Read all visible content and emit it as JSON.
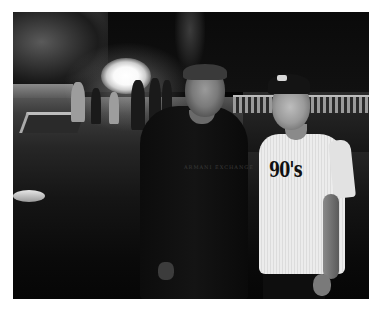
{
  "image": {
    "description": "Black-and-white night photo of two men posing on a lawn with a film-set light and crew behind them",
    "border_color": "#ffffff",
    "tone": "monochrome"
  },
  "subjects": {
    "left_man": {
      "clothing": "dark long-sleeve sweater",
      "shirt_text": "ARMANI EXCHANGE"
    },
    "right_man": {
      "clothing": "white t-shirt and baseball cap",
      "shirt_text": "90's"
    }
  },
  "background": {
    "elements": [
      "trees",
      "bright film light",
      "crew members",
      "stone balustrade",
      "pool edge",
      "grass lawn"
    ]
  }
}
